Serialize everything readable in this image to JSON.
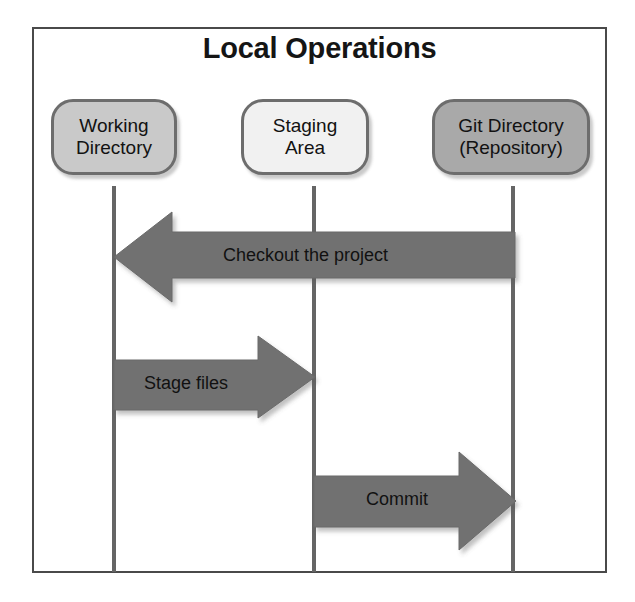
{
  "figure": {
    "title": "Local Operations",
    "frame_color": "#4a4a4a",
    "background": "#ffffff"
  },
  "nodes": [
    {
      "id": "working-directory",
      "label_line1": "Working",
      "label_line2": "Directory",
      "fill": "#c9c9c9",
      "border": "#6d6d6d"
    },
    {
      "id": "staging-area",
      "label_line1": "Staging",
      "label_line2": "Area",
      "fill": "#f1f1f1",
      "border": "#6d6d6d"
    },
    {
      "id": "git-directory",
      "label_line1": "Git Directory",
      "label_line2": "(Repository)",
      "fill": "#a9a9a9",
      "border": "#6d6d6d"
    }
  ],
  "arrows": [
    {
      "id": "checkout",
      "label": "Checkout the project",
      "direction": "left",
      "from": "git-directory",
      "to": "working-directory",
      "fill": "#717171"
    },
    {
      "id": "stage-files",
      "label": "Stage files",
      "direction": "right",
      "from": "working-directory",
      "to": "staging-area",
      "fill": "#717171"
    },
    {
      "id": "commit",
      "label": "Commit",
      "direction": "right",
      "from": "staging-area",
      "to": "git-directory",
      "fill": "#717171"
    }
  ],
  "lifelines": {
    "color": "#656565",
    "count": 3
  }
}
